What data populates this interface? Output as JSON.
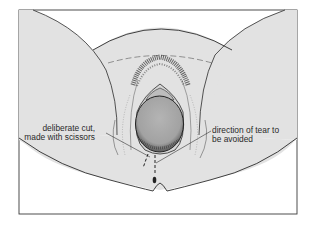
{
  "figure": {
    "colors": {
      "background": "#ffffff",
      "skin": "#e2e2e2",
      "outline": "#2b2b2b",
      "head": "#a9a9a9",
      "hair": "#3a3a3a"
    }
  },
  "labels": {
    "left": {
      "line1": "deliberate cut,",
      "line2": "made with scissors"
    },
    "right": {
      "line1": "direction of tear to",
      "line2": "be avoided"
    }
  }
}
